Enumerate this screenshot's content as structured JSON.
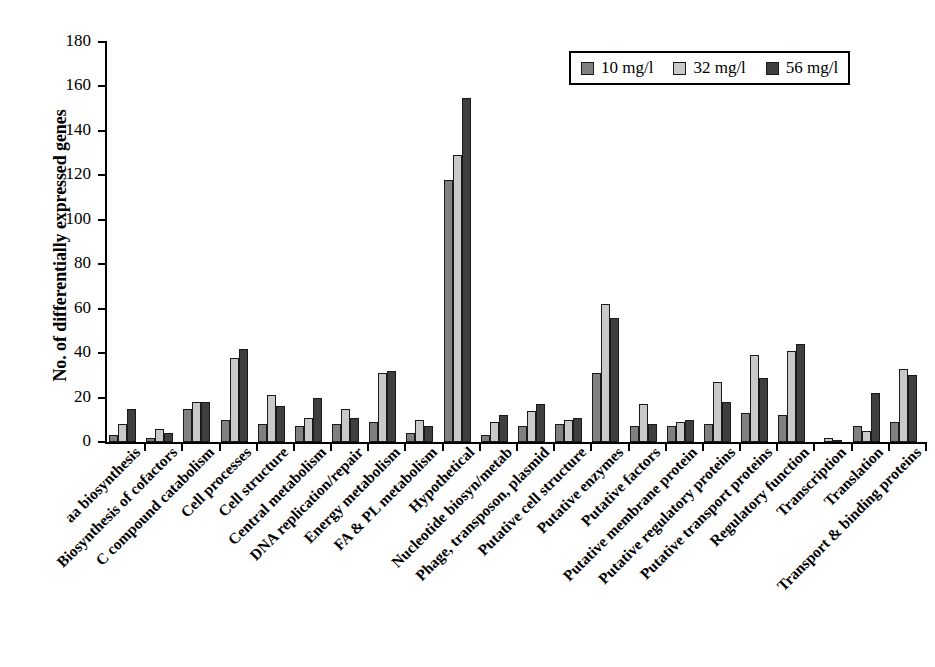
{
  "chart_data": {
    "type": "bar",
    "title": "",
    "xlabel": "",
    "ylabel": "No. of differentially expressed genes",
    "ylim": [
      0,
      180
    ],
    "yticks": [
      0,
      20,
      40,
      60,
      80,
      100,
      120,
      140,
      160,
      180
    ],
    "grid": false,
    "legend_position": "top-right",
    "categories": [
      "aa biosynthesis",
      "Biosynthesis of cofactors",
      "C compound catabolism",
      "Cell processes",
      "Cell structure",
      "Central metabolism",
      "DNA replication/repair",
      "Energy metabolism",
      "FA & PL metabolism",
      "Hypothetical",
      "Nucleotide biosyn/metab",
      "Phage, transposon, plasmid",
      "Putative cell structure",
      "Putative enzymes",
      "Putative factors",
      "Putative membrane protein",
      "Putative regulatory proteins",
      "Putative transport proteins",
      "Regulatory function",
      "Transcription",
      "Translation",
      "Transport & binding proteins"
    ],
    "series": [
      {
        "name": "10 mg/l",
        "color": "#808080",
        "values": [
          3,
          2,
          15,
          10,
          8,
          7,
          8,
          9,
          4,
          118,
          3,
          7,
          8,
          31,
          7,
          7,
          8,
          13,
          12,
          0,
          7,
          9
        ]
      },
      {
        "name": "32 mg/l",
        "color": "#c9c9c9",
        "values": [
          8,
          6,
          18,
          38,
          21,
          11,
          15,
          31,
          10,
          129,
          9,
          14,
          10,
          62,
          17,
          9,
          27,
          39,
          41,
          2,
          5,
          33
        ]
      },
      {
        "name": "56 mg/l",
        "color": "#3f3f3f",
        "values": [
          15,
          4,
          18,
          42,
          16,
          20,
          11,
          32,
          7,
          155,
          12,
          17,
          11,
          56,
          8,
          10,
          18,
          29,
          44,
          1,
          22,
          30
        ]
      }
    ]
  },
  "legend": {
    "entries": [
      {
        "label": "10 mg/l",
        "swatch": "legend-swatch-10"
      },
      {
        "label": "32 mg/l",
        "swatch": "legend-swatch-32"
      },
      {
        "label": "56 mg/l",
        "swatch": "legend-swatch-56"
      }
    ]
  }
}
